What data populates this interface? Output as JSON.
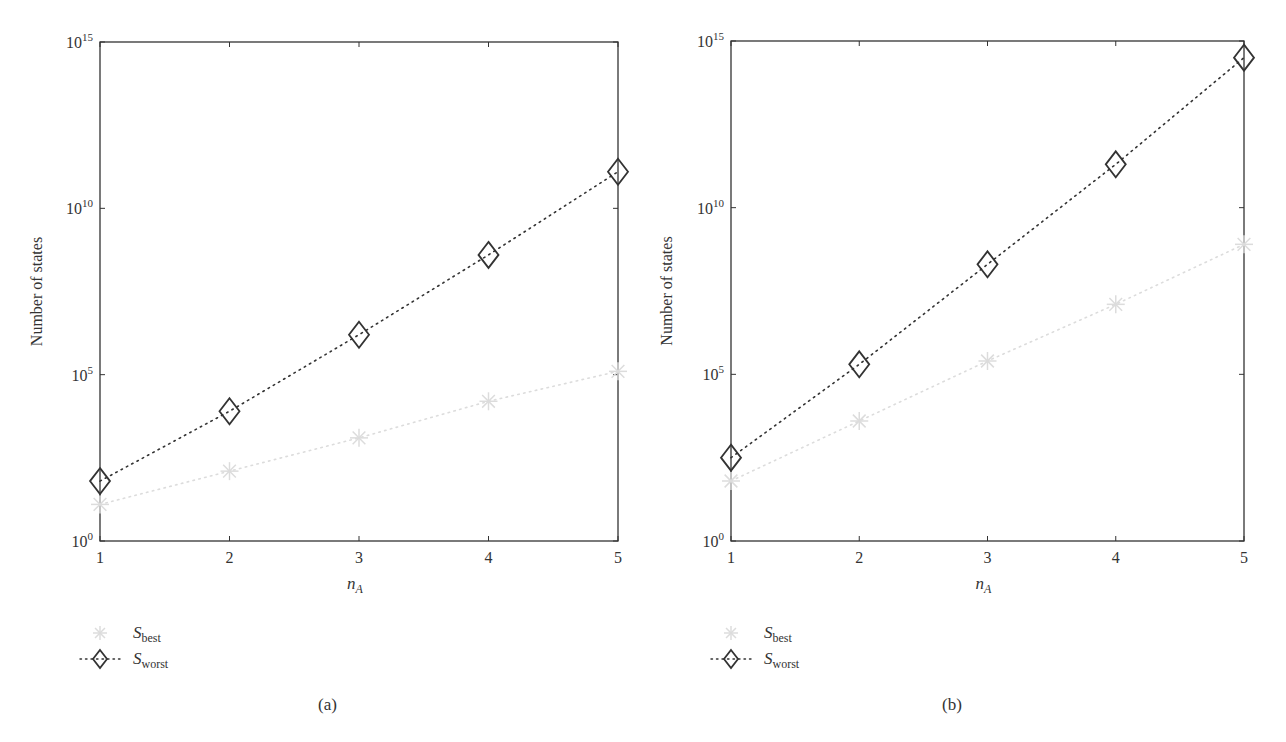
{
  "colors": {
    "axis": "#333333",
    "worst": "#333333",
    "best": "#dcdcdc"
  },
  "chart_data": [
    {
      "type": "line",
      "panel": "(a)",
      "title": "",
      "xlabel": "n_A",
      "ylabel": "Number of states",
      "yscale": "log",
      "ylim": [
        1,
        1000000000000000.0
      ],
      "xlim": [
        1,
        5
      ],
      "x": [
        1,
        2,
        3,
        4,
        5
      ],
      "x_ticks": [
        "1",
        "2",
        "3",
        "4",
        "5"
      ],
      "y_ticks": [
        {
          "base": "10",
          "exp": "0",
          "log": 0
        },
        {
          "base": "10",
          "exp": "5",
          "log": 5
        },
        {
          "base": "10",
          "exp": "10",
          "log": 10
        },
        {
          "base": "10",
          "exp": "15",
          "log": 15
        }
      ],
      "grid": false,
      "legend_position": "below-left",
      "series": [
        {
          "name": "S_best",
          "label_main": "S",
          "label_sub": "best",
          "marker": "asterisk",
          "line": "dotted",
          "log10_values": [
            1.1,
            2.1,
            3.1,
            4.2,
            5.1
          ],
          "values": [
            13,
            126,
            1259,
            15849,
            125893
          ]
        },
        {
          "name": "S_worst",
          "label_main": "S",
          "label_sub": "worst",
          "marker": "diamond",
          "line": "dotted",
          "log10_values": [
            1.8,
            3.9,
            6.2,
            8.6,
            11.1
          ],
          "values": [
            63,
            7943,
            1584893,
            398107171,
            125892541179
          ]
        }
      ]
    },
    {
      "type": "line",
      "panel": "(b)",
      "title": "",
      "xlabel": "n_A",
      "ylabel": "Number of states",
      "yscale": "log",
      "ylim": [
        1,
        1000000000000000.0
      ],
      "xlim": [
        1,
        5
      ],
      "x": [
        1,
        2,
        3,
        4,
        5
      ],
      "x_ticks": [
        "1",
        "2",
        "3",
        "4",
        "5"
      ],
      "y_ticks": [
        {
          "base": "10",
          "exp": "0",
          "log": 0
        },
        {
          "base": "10",
          "exp": "5",
          "log": 5
        },
        {
          "base": "10",
          "exp": "10",
          "log": 10
        },
        {
          "base": "10",
          "exp": "15",
          "log": 15
        }
      ],
      "grid": false,
      "legend_position": "below-left",
      "series": [
        {
          "name": "S_best",
          "label_main": "S",
          "label_sub": "best",
          "marker": "asterisk",
          "line": "dotted",
          "log10_values": [
            1.8,
            3.6,
            5.4,
            7.1,
            8.9
          ],
          "values": [
            63,
            3981,
            251189,
            12589254,
            794328235
          ]
        },
        {
          "name": "S_worst",
          "label_main": "S",
          "label_sub": "worst",
          "marker": "diamond",
          "line": "dotted",
          "log10_values": [
            2.5,
            5.3,
            8.3,
            11.3,
            14.5
          ],
          "values": [
            316,
            199526,
            199526231,
            199526231497,
            316227766016838
          ]
        }
      ]
    }
  ],
  "panels": [
    {
      "caption": "(a)"
    },
    {
      "caption": "(b)"
    }
  ]
}
